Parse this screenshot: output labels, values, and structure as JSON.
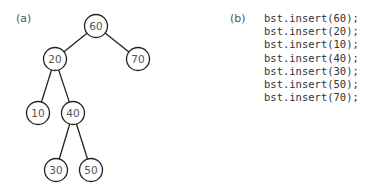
{
  "panels": {
    "a": {
      "label": "(a)"
    },
    "b": {
      "label": "(b)"
    }
  },
  "tree": {
    "nodes": [
      {
        "id": "n60",
        "value": "60",
        "cx": 96,
        "cy": 26
      },
      {
        "id": "n20",
        "value": "20",
        "cx": 55,
        "cy": 59
      },
      {
        "id": "n70",
        "value": "70",
        "cx": 138,
        "cy": 59
      },
      {
        "id": "n10",
        "value": "10",
        "cx": 38,
        "cy": 113
      },
      {
        "id": "n40",
        "value": "40",
        "cx": 73,
        "cy": 113
      },
      {
        "id": "n30",
        "value": "30",
        "cx": 56,
        "cy": 170
      },
      {
        "id": "n50",
        "value": "50",
        "cx": 91,
        "cy": 170
      }
    ],
    "edges": [
      [
        "n60",
        "n20"
      ],
      [
        "n60",
        "n70"
      ],
      [
        "n20",
        "n10"
      ],
      [
        "n20",
        "n40"
      ],
      [
        "n40",
        "n30"
      ],
      [
        "n40",
        "n50"
      ]
    ],
    "radius": 11.5
  },
  "code": {
    "lines": [
      "bst.insert(60);",
      "bst.insert(20);",
      "bst.insert(10);",
      "bst.insert(40);",
      "bst.insert(30);",
      "bst.insert(50);",
      "bst.insert(70);"
    ]
  }
}
